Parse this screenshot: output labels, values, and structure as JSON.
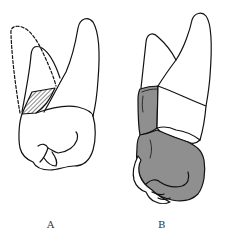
{
  "diagram": {
    "type": "dental-illustration",
    "figures": [
      {
        "id": "A",
        "label": "A",
        "description": "Tooth with a missing cusp shown as a dashed outline and a hatched fracture area"
      },
      {
        "id": "B",
        "label": "B",
        "description": "Tooth with a gray-shaded crown restoration and a white band around the root"
      }
    ],
    "colors": {
      "outline": "#111111",
      "restoration": "#8f8f8f",
      "background": "#ffffff"
    }
  }
}
